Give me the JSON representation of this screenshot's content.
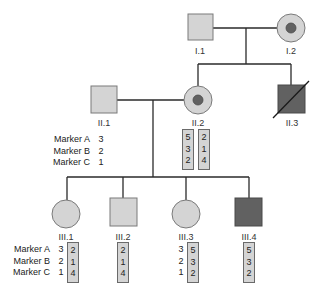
{
  "colors": {
    "unaffected_fill": "#d4d4d4",
    "affected_fill": "#616161",
    "carrier_dot": "#616161",
    "line": "#2a2a2a",
    "outline": "#7a7a7a"
  },
  "markers": [
    "Marker A",
    "Marker B",
    "Marker C"
  ],
  "generations": {
    "I": [
      {
        "id": "I.1",
        "label": "I.1",
        "sex": "male",
        "status": "unaffected"
      },
      {
        "id": "I.2",
        "label": "I.2",
        "sex": "female",
        "status": "carrier"
      }
    ],
    "II": [
      {
        "id": "II.1",
        "label": "II.1",
        "sex": "male",
        "status": "unaffected",
        "haplotypes": [
          [
            "3",
            "2",
            "1"
          ]
        ]
      },
      {
        "id": "II.2",
        "label": "II.2",
        "sex": "female",
        "status": "carrier",
        "haplotypes": [
          [
            "5",
            "3",
            "2"
          ],
          [
            "2",
            "1",
            "4"
          ]
        ]
      },
      {
        "id": "II.3",
        "label": "II.3",
        "sex": "male",
        "status": "affected-deceased"
      }
    ],
    "III": [
      {
        "id": "III.1",
        "label": "III.1",
        "sex": "female",
        "status": "unaffected",
        "paternal": [
          "3",
          "2",
          "1"
        ],
        "maternal": [
          "2",
          "1",
          "4"
        ]
      },
      {
        "id": "III.2",
        "label": "III.2",
        "sex": "male",
        "status": "unaffected",
        "maternal": [
          "2",
          "1",
          "4"
        ]
      },
      {
        "id": "III.3",
        "label": "III.3",
        "sex": "female",
        "status": "unaffected",
        "paternal": [
          "3",
          "2",
          "1"
        ],
        "maternal": [
          "5",
          "3",
          "2"
        ]
      },
      {
        "id": "III.4",
        "label": "III.4",
        "sex": "male",
        "status": "affected",
        "maternal": [
          "5",
          "3",
          "2"
        ]
      }
    ]
  }
}
